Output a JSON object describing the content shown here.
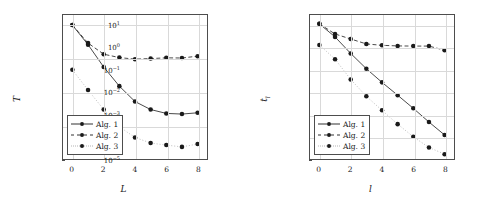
{
  "figure": {
    "panels": [
      {
        "id": "left",
        "ylabel": "T",
        "ylabel_sub": "",
        "xlabel": "L",
        "ytick_labels": [
          "10",
          "10",
          "10",
          "10",
          "10"
        ],
        "ytick_exponents": [
          "4",
          "3",
          "2",
          "1",
          "0"
        ],
        "xtick_labels": [
          "0",
          "2",
          "4",
          "6",
          "8"
        ],
        "legend": [
          {
            "label": "Alg. 1",
            "style": "solid"
          },
          {
            "label": "Alg. 2",
            "style": "dashed"
          },
          {
            "label": "Alg. 3",
            "style": "dotted"
          }
        ]
      },
      {
        "id": "right",
        "ylabel": "t",
        "ylabel_sub": "l",
        "xlabel": "l",
        "ytick_labels": [
          "10",
          "10",
          "10",
          "10",
          "10",
          "10",
          "10"
        ],
        "ytick_exponents": [
          "1",
          "0",
          "−1",
          "−2",
          "−3",
          "−4",
          "−5"
        ],
        "xtick_labels": [
          "0",
          "2",
          "4",
          "6",
          "8"
        ],
        "legend": [
          {
            "label": "Alg. 1",
            "style": "solid"
          },
          {
            "label": "Alg. 2",
            "style": "dashed"
          },
          {
            "label": "Alg. 3",
            "style": "dotted"
          }
        ]
      }
    ]
  },
  "chart_data": [
    {
      "type": "line",
      "id": "left-panel-convergence",
      "title": "",
      "xlabel": "L",
      "ylabel": "T",
      "yscale": "log",
      "xscale": "linear",
      "xlim": [
        -0.6,
        8.6
      ],
      "ylim": [
        1,
        20000
      ],
      "grid": true,
      "legend_position": "lower-left",
      "x": [
        0,
        1,
        2,
        3,
        4,
        5,
        6,
        7,
        8
      ],
      "series": [
        {
          "name": "Alg. 1",
          "style": "solid",
          "marker": "circle",
          "color": "#1a1a1a",
          "values": [
            10000,
            2600,
            560,
            150,
            52,
            30,
            23,
            22,
            24
          ]
        },
        {
          "name": "Alg. 2",
          "style": "dashed",
          "marker": "circle",
          "color": "#1a1a1a",
          "values": [
            10000,
            2900,
            1350,
            1070,
            960,
            1000,
            1050,
            1040,
            1180
          ]
        },
        {
          "name": "Alg. 3",
          "style": "dotted",
          "marker": "circle",
          "color": "#1a1a1a",
          "values": [
            460,
            115,
            30,
            9.2,
            4.4,
            3.0,
            2.6,
            2.3,
            2.8
          ]
        }
      ]
    },
    {
      "type": "line",
      "id": "right-panel-residual",
      "title": "",
      "xlabel": "l",
      "ylabel": "t_l",
      "yscale": "log",
      "xscale": "linear",
      "xlim": [
        -0.6,
        8.6
      ],
      "ylim": [
        1e-05,
        30
      ],
      "grid": true,
      "legend_position": "lower-left",
      "x": [
        0,
        1,
        2,
        3,
        4,
        5,
        6,
        7,
        8
      ],
      "series": [
        {
          "name": "Alg. 1",
          "style": "solid",
          "marker": "circle",
          "color": "#1a1a1a",
          "values": [
            12,
            3.1,
            0.56,
            0.115,
            0.028,
            0.0074,
            0.0019,
            0.00046,
            0.00012
          ]
        },
        {
          "name": "Alg. 2",
          "style": "dashed",
          "marker": "circle",
          "color": "#1a1a1a",
          "values": [
            12,
            4.2,
            2.5,
            1.5,
            1.3,
            1.22,
            1.2,
            1.2,
            0.78
          ]
        },
        {
          "name": "Alg. 3",
          "style": "dotted",
          "marker": "circle",
          "color": "#1a1a1a",
          "values": [
            1.35,
            0.31,
            0.038,
            0.0066,
            0.00155,
            0.00037,
            0.0001,
            3.3e-05,
            1.65e-05
          ]
        }
      ]
    }
  ]
}
